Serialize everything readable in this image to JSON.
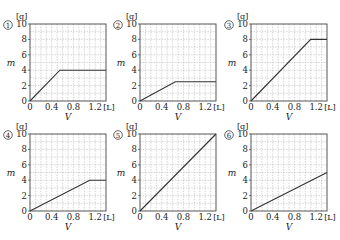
{
  "top_fragment": "",
  "axis": {
    "y_unit": "[g]",
    "x_unit": "[L]",
    "y_label": "m",
    "x_label": "V",
    "y_ticks": [
      "0",
      "2",
      "4",
      "6",
      "8",
      "10"
    ],
    "x_ticks": [
      "0",
      "0.4",
      "0.8",
      "1.2"
    ]
  },
  "chart_data": [
    {
      "type": "line",
      "id": "1",
      "title": "①",
      "xlabel": "V [L]",
      "ylabel": "m [g]",
      "xlim": [
        0,
        1.4
      ],
      "ylim": [
        0,
        10
      ],
      "grid": true,
      "x": [
        0,
        0.55,
        1.4
      ],
      "y": [
        0,
        4,
        4
      ]
    },
    {
      "type": "line",
      "id": "2",
      "title": "②",
      "xlabel": "V [L]",
      "ylabel": "m [g]",
      "xlim": [
        0,
        1.4
      ],
      "ylim": [
        0,
        10
      ],
      "grid": true,
      "x": [
        0,
        0.65,
        1.4
      ],
      "y": [
        0,
        2.5,
        2.5
      ]
    },
    {
      "type": "line",
      "id": "3",
      "title": "③",
      "xlabel": "V [L]",
      "ylabel": "m [g]",
      "xlim": [
        0,
        1.4
      ],
      "ylim": [
        0,
        10
      ],
      "grid": true,
      "x": [
        0,
        1.1,
        1.4
      ],
      "y": [
        0,
        8,
        8
      ]
    },
    {
      "type": "line",
      "id": "4",
      "title": "④",
      "xlabel": "V [L]",
      "ylabel": "m [g]",
      "xlim": [
        0,
        1.4
      ],
      "ylim": [
        0,
        10
      ],
      "grid": true,
      "x": [
        0,
        1.1,
        1.4
      ],
      "y": [
        0,
        4,
        4
      ]
    },
    {
      "type": "line",
      "id": "5",
      "title": "⑤",
      "xlabel": "V [L]",
      "ylabel": "m [g]",
      "xlim": [
        0,
        1.4
      ],
      "ylim": [
        0,
        10
      ],
      "grid": true,
      "x": [
        0,
        1.4
      ],
      "y": [
        0,
        10
      ]
    },
    {
      "type": "line",
      "id": "6",
      "title": "⑥",
      "xlabel": "V [L]",
      "ylabel": "m [g]",
      "xlim": [
        0,
        1.4
      ],
      "ylim": [
        0,
        10
      ],
      "grid": true,
      "x": [
        0,
        1.4
      ],
      "y": [
        0,
        5
      ]
    }
  ],
  "panels": [
    {
      "badge": "1",
      "left": 0,
      "top": 10
    },
    {
      "badge": "2",
      "left": 110,
      "top": 10
    },
    {
      "badge": "3",
      "left": 221,
      "top": 10
    },
    {
      "badge": "4",
      "left": 0,
      "top": 120
    },
    {
      "badge": "5",
      "left": 110,
      "top": 120
    },
    {
      "badge": "6",
      "left": 221,
      "top": 120
    }
  ],
  "colors": {
    "line": "#333333",
    "grid": "#b8b8b8",
    "frame": "#444444",
    "text": "#222222"
  }
}
